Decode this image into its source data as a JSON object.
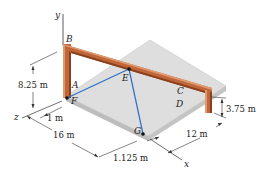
{
  "figure": {
    "type": "statics-3d-frame-with-cables",
    "points": {
      "A": "A",
      "B": "B",
      "C": "C",
      "D": "D",
      "E": "E",
      "F": "F",
      "G": "G"
    },
    "axes": {
      "x": "x",
      "y": "y",
      "z": "z"
    },
    "dimensions": {
      "height_AB": "8.25 m",
      "offset_F": "1 m",
      "length_16": "16 m",
      "offset_G": "1.125 m",
      "width_12": "12 m",
      "height_CD": "3.75 m"
    },
    "colors": {
      "frame": "#c0673a",
      "frame_dark": "#8a3f1e",
      "frame_light": "#e09a70",
      "cable": "#2e6fc4",
      "slab_top": "#dcdcdc",
      "slab_edge": "#b5b5b5",
      "line": "#333333"
    }
  }
}
